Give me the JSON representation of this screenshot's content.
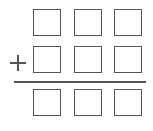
{
  "diagram": {
    "type": "vertical-addition-template",
    "operator": "+",
    "rows": [
      {
        "role": "addend-1",
        "cells": [
          "",
          "",
          ""
        ]
      },
      {
        "role": "addend-2",
        "cells": [
          "",
          "",
          ""
        ]
      },
      {
        "role": "sum",
        "cells": [
          "",
          "",
          ""
        ]
      }
    ],
    "stroke_color": "#555555"
  }
}
